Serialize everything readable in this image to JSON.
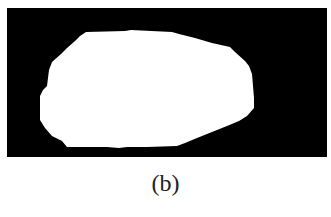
{
  "figure": {
    "caption": "(b)",
    "panel": {
      "background_color": "#000000",
      "foreground_color": "#ffffff",
      "description": "binary segmentation mask: white blob on black background"
    }
  }
}
